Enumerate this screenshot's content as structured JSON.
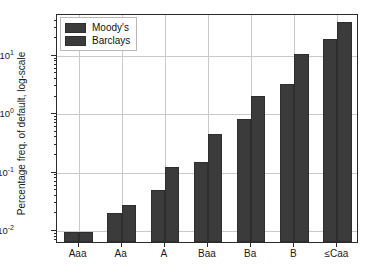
{
  "chart_data": {
    "type": "bar",
    "title": "",
    "xlabel": "",
    "ylabel": "Percentage freq. of default, log-scale",
    "yscale": "log",
    "ylim": [
      0.006,
      50
    ],
    "grid": true,
    "legend_position": "upper left",
    "categories": [
      "Aaa",
      "Aa",
      "A",
      "Baa",
      "Ba",
      "B",
      "≤Caa"
    ],
    "series": [
      {
        "name": "Moody's",
        "values": [
          0.009,
          0.019,
          0.047,
          0.14,
          0.78,
          3.1,
          18.0
        ]
      },
      {
        "name": "Barclays",
        "values": [
          0.009,
          0.026,
          0.115,
          0.43,
          1.9,
          9.8,
          35.0
        ]
      }
    ],
    "ytick_labels": [
      "10⁻²",
      "10⁻¹",
      "10⁰",
      "10¹"
    ],
    "ytick_values": [
      0.01,
      0.1,
      1,
      10
    ],
    "ytick_mantissa": [
      "10",
      "10",
      "10",
      "10"
    ],
    "ytick_exponent": [
      "-2",
      "-1",
      "0",
      "1"
    ],
    "bar_color": "#3b3b3b",
    "grid_color": "#c9c9c9",
    "axis_color": "#2b2b2b"
  },
  "legend": {
    "entries": [
      {
        "label": "Moody's"
      },
      {
        "label": "Barclays"
      }
    ]
  }
}
